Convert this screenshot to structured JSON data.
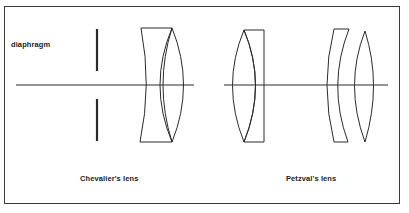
{
  "figure": {
    "labels": {
      "diaphragm": "diaphragm",
      "left_caption": "Chevalier's lens",
      "right_caption": "Petzval's lens"
    },
    "colors": {
      "line": "#2a2a2a",
      "border": "#3a3a3a",
      "background": "#ffffff"
    },
    "elements": [
      {
        "name": "diaphragm",
        "type": "aperture-stop"
      },
      {
        "name": "chevalier-concave-element",
        "type": "plano-concave lens"
      },
      {
        "name": "chevalier-convex-element",
        "type": "biconvex lens"
      },
      {
        "name": "petzval-front-convex",
        "type": "biconvex lens"
      },
      {
        "name": "petzval-front-flint",
        "type": "plano-concave lens"
      },
      {
        "name": "petzval-rear-meniscus",
        "type": "meniscus lens"
      },
      {
        "name": "petzval-rear-convex",
        "type": "biconvex lens"
      }
    ]
  }
}
